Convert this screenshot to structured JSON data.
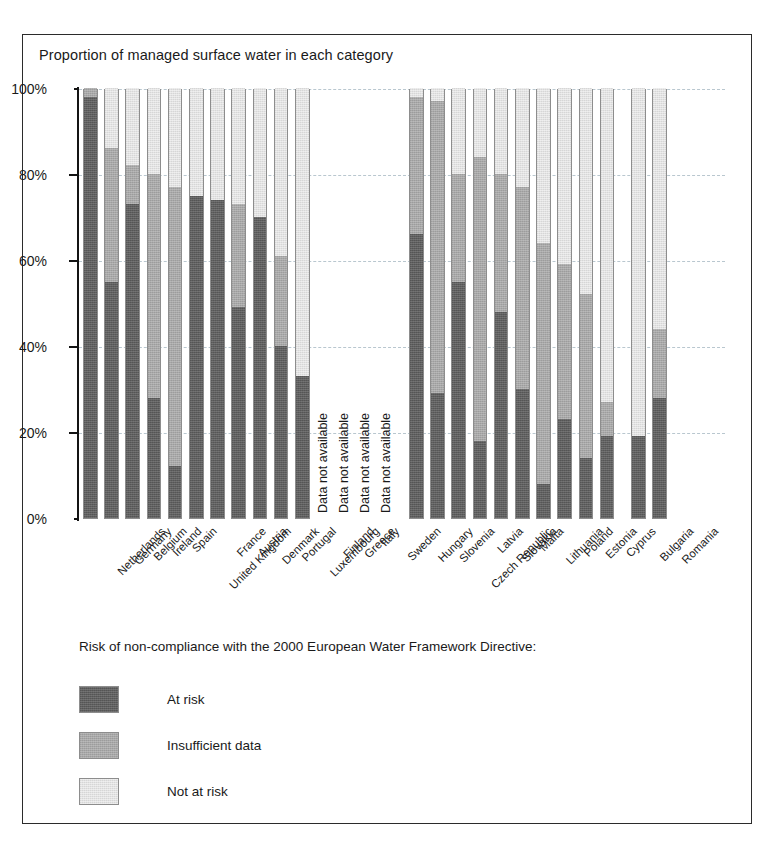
{
  "figure": {
    "title": "Proportion of managed surface water in each category"
  },
  "legend": {
    "title": "Risk of  non-compliance with the 2000 European Water Framework Directive:",
    "entries": [
      {
        "label": "At risk",
        "key": "at_risk",
        "color": "#5f5f5f"
      },
      {
        "label": "Insufficient data",
        "key": "insufficient_data",
        "color": "#a8a8a8"
      },
      {
        "label": "Not at risk",
        "key": "not_at_risk",
        "color": "#e2e2e2"
      }
    ]
  },
  "annotations": {
    "no_data_text": "Data not available"
  },
  "chart_data": {
    "type": "bar",
    "subtype": "stacked-bar-100pct",
    "title": "Proportion of managed surface water in each category",
    "xlabel": "",
    "ylabel": "",
    "ylim": [
      0,
      100
    ],
    "yunit": "%",
    "grid": true,
    "legend_position": "below-plot-left",
    "yticks": [
      "0%",
      "20%",
      "40%",
      "60%",
      "80%",
      "100%"
    ],
    "ytick_values": [
      0,
      20,
      40,
      60,
      80,
      100
    ],
    "categories": [
      "Netherlands",
      "Germany",
      "Belgium",
      "Ireland",
      "Spain",
      "United Kingdom",
      "France",
      "Austria",
      "Denmark",
      "Portugal",
      "Luxembourg",
      "Finland",
      "Greece",
      "Italy",
      "Sweden",
      "Hungary",
      "Slovenia",
      "Czech Republic",
      "Latvia",
      "Slovakia",
      "Malta",
      "Lithuania",
      "Poland",
      "Estonia",
      "Cyprus",
      "Bulgaria",
      "Romania"
    ],
    "series": [
      {
        "name": "At risk",
        "key": "at_risk",
        "color": "#5f5f5f",
        "values": [
          98,
          55,
          73,
          28,
          12,
          75,
          74,
          49,
          70,
          40,
          33,
          null,
          null,
          null,
          null,
          66,
          29,
          55,
          18,
          48,
          30,
          8,
          23,
          14,
          19,
          19,
          28
        ]
      },
      {
        "name": "Insufficient data",
        "key": "insufficient_data",
        "color": "#a8a8a8",
        "values": [
          2,
          31,
          9,
          52,
          65,
          0,
          0,
          24,
          0,
          21,
          0,
          null,
          null,
          null,
          null,
          32,
          68,
          25,
          66,
          32,
          47,
          56,
          36,
          38,
          8,
          0,
          16
        ]
      },
      {
        "name": "Not at risk",
        "key": "not_at_risk",
        "color": "#e2e2e2",
        "values": [
          0,
          14,
          18,
          20,
          23,
          25,
          26,
          27,
          30,
          39,
          67,
          null,
          null,
          null,
          null,
          2,
          3,
          20,
          16,
          20,
          23,
          36,
          41,
          48,
          73,
          81,
          56
        ]
      }
    ],
    "no_data_categories": [
      "Finland",
      "Greece",
      "Italy",
      "Sweden"
    ],
    "no_data_label": "Data not available"
  }
}
